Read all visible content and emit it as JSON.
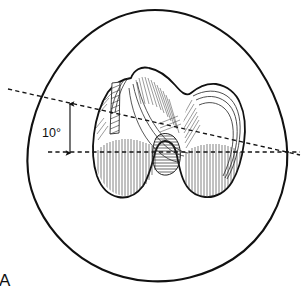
{
  "figure": {
    "kind": "anatomical-line-drawing",
    "panel_label": "A",
    "angle_label": "10°",
    "colors": {
      "background": "#ffffff",
      "ink": "#101010",
      "outline": "#111111",
      "hatch": "#2a2a2a",
      "dashed": "#141414"
    },
    "outer_outline": {
      "name": "soft-tissue-egg-outline",
      "stroke_width": 2.1,
      "path": "M 155 10 C 196 10 236 33 260 70 C 281 102 289 137 287 165 C 284 203 265 238 233 259 C 205 277 174 283 148 281 C 116 279 86 265 64 243 C 42 221 30 194 28 172 C 25 144 33 107 54 74 C 79 35 115 10 155 10 Z"
    },
    "bone_outline": {
      "name": "distal-femur-contour",
      "stroke_width": 1.8,
      "path": "M 131 78 C 134 70 141 66 149 68 C 159 70 168 77 175 85 C 181 92 186 97 191 93 C 197 88 206 83 216 84 C 227 86 236 93 240 103 C 245 114 246 128 244 143 C 242 158 238 172 232 182 C 226 192 216 198 205 197 C 194 196 187 189 183 179 C 179 169 178 159 176 152 C 174 145 170 141 165 141 C 160 141 157 146 155 153 C 152 164 149 177 143 186 C 137 194 128 199 118 197 C 108 195 101 187 97 176 C 93 164 92 149 94 134 C 96 118 101 103 108 92 C 115 83 123 79 131 78 Z"
    },
    "reference_lines": [
      {
        "name": "posterior-condylar-axis-tilted",
        "style": "dashed",
        "x1": 8,
        "y1": 89,
        "x2": 300,
        "y2": 155
      },
      {
        "name": "horizontal-reference-axis",
        "style": "dashed",
        "x1": 48,
        "y1": 152,
        "x2": 300,
        "y2": 152
      }
    ],
    "angle_annotation": {
      "name": "ten-degree-angle-arrow",
      "arrow_x": 70,
      "arrow_y_top": 105,
      "arrow_y_bottom": 152,
      "label_x": 43,
      "label_y": 133
    }
  }
}
